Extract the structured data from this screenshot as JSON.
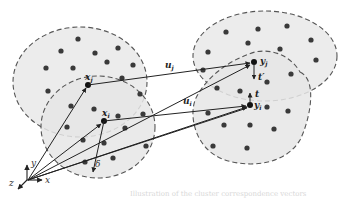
{
  "figure": {
    "colors": {
      "background": "#ffffff",
      "cluster_fill": "#ececec",
      "cluster_stroke": "#555555",
      "dot": "#3a3a3a",
      "arrow": "#222222"
    },
    "clusters": [
      {
        "id": "left-outer",
        "cx": 82,
        "cy": 82,
        "rx": 68,
        "ry": 55
      },
      {
        "id": "left-inner",
        "cx": 97,
        "cy": 127,
        "rx": 58,
        "ry": 50
      },
      {
        "id": "right-outer",
        "cx": 265,
        "cy": 55,
        "rx": 72,
        "ry": 47
      },
      {
        "id": "right-inner",
        "cx": 255,
        "cy": 118,
        "rx": 67,
        "ry": 58
      }
    ],
    "points": {
      "x_j": {
        "label": "x",
        "sub": "j",
        "x": 88,
        "y": 85
      },
      "x_i": {
        "label": "x",
        "sub": "i",
        "x": 104,
        "y": 121
      },
      "y_j": {
        "label": "y",
        "sub": "j",
        "x": 250,
        "y": 62
      },
      "y_i": {
        "label": "y",
        "sub": "i",
        "x": 251,
        "y": 105
      }
    },
    "vectors": [
      {
        "name": "u_j",
        "label": "u",
        "sub": "j"
      },
      {
        "name": "u_i",
        "label": "u",
        "sub": "i"
      },
      {
        "name": "t_prime",
        "label": "t′"
      },
      {
        "name": "t",
        "label": "t"
      },
      {
        "name": "delta",
        "label": "δ"
      }
    ],
    "axes": {
      "x": "x",
      "y": "y",
      "z": "z"
    },
    "caption": "Illustration of the cluster correspondence vectors"
  }
}
